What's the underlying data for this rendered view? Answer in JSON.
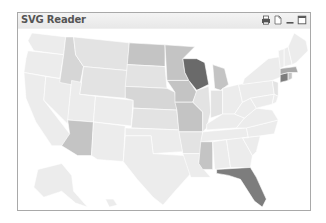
{
  "window": {
    "title": "SVG Reader",
    "controls": [
      {
        "name": "print-icon",
        "label": "Print"
      },
      {
        "name": "export-icon",
        "label": "Export"
      },
      {
        "name": "minimize-icon",
        "label": "Minimize"
      },
      {
        "name": "maximize-icon",
        "label": "Maximize"
      }
    ]
  },
  "map": {
    "type": "choropleth",
    "region": "United States",
    "color_scale": {
      "lightest": "#ececec",
      "light": "#e3e3e3",
      "medium_light": "#d6d6d6",
      "medium": "#c4c4c4",
      "medium_dark": "#a9a9a9",
      "dark": "#7d7d7d",
      "darkest": "#6a6a6a"
    },
    "states": [
      {
        "id": "WA",
        "shade": "lightest"
      },
      {
        "id": "OR",
        "shade": "lightest"
      },
      {
        "id": "CA",
        "shade": "lightest"
      },
      {
        "id": "NV",
        "shade": "lightest"
      },
      {
        "id": "ID",
        "shade": "medium_light"
      },
      {
        "id": "MT",
        "shade": "light"
      },
      {
        "id": "WY",
        "shade": "light"
      },
      {
        "id": "UT",
        "shade": "lightest"
      },
      {
        "id": "AZ",
        "shade": "medium"
      },
      {
        "id": "CO",
        "shade": "lightest"
      },
      {
        "id": "NM",
        "shade": "lightest"
      },
      {
        "id": "ND",
        "shade": "medium"
      },
      {
        "id": "SD",
        "shade": "light"
      },
      {
        "id": "NE",
        "shade": "medium_light"
      },
      {
        "id": "KS",
        "shade": "light"
      },
      {
        "id": "OK",
        "shade": "lightest"
      },
      {
        "id": "TX",
        "shade": "lightest"
      },
      {
        "id": "MN",
        "shade": "medium"
      },
      {
        "id": "IA",
        "shade": "medium"
      },
      {
        "id": "MO",
        "shade": "medium"
      },
      {
        "id": "AR",
        "shade": "light"
      },
      {
        "id": "LA",
        "shade": "lightest"
      },
      {
        "id": "WI",
        "shade": "darkest"
      },
      {
        "id": "IL",
        "shade": "light"
      },
      {
        "id": "MI",
        "shade": "medium"
      },
      {
        "id": "IN",
        "shade": "light"
      },
      {
        "id": "OH",
        "shade": "lightest"
      },
      {
        "id": "KY",
        "shade": "lightest"
      },
      {
        "id": "TN",
        "shade": "lightest"
      },
      {
        "id": "MS",
        "shade": "medium"
      },
      {
        "id": "AL",
        "shade": "lightest"
      },
      {
        "id": "GA",
        "shade": "lightest"
      },
      {
        "id": "FL",
        "shade": "dark"
      },
      {
        "id": "SC",
        "shade": "lightest"
      },
      {
        "id": "NC",
        "shade": "lightest"
      },
      {
        "id": "VA",
        "shade": "lightest"
      },
      {
        "id": "WV",
        "shade": "lightest"
      },
      {
        "id": "PA",
        "shade": "lightest"
      },
      {
        "id": "NY",
        "shade": "lightest"
      },
      {
        "id": "NJ",
        "shade": "light"
      },
      {
        "id": "MD",
        "shade": "lightest"
      },
      {
        "id": "DE",
        "shade": "lightest"
      },
      {
        "id": "CT",
        "shade": "dark"
      },
      {
        "id": "RI",
        "shade": "medium"
      },
      {
        "id": "MA",
        "shade": "medium_dark"
      },
      {
        "id": "VT",
        "shade": "lightest"
      },
      {
        "id": "NH",
        "shade": "lightest"
      },
      {
        "id": "ME",
        "shade": "lightest"
      },
      {
        "id": "AK",
        "shade": "lightest"
      },
      {
        "id": "HI",
        "shade": "lightest"
      }
    ]
  }
}
